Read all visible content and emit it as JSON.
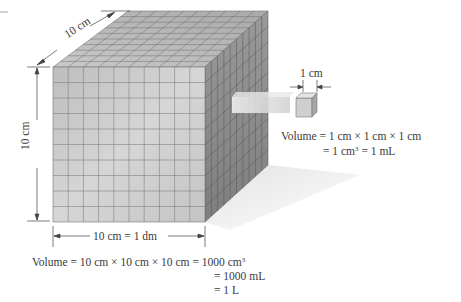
{
  "diagram": {
    "large_cube": {
      "depth_label": "10 cm",
      "height_label": "10 cm",
      "width_label": "10 cm = 1 dm",
      "grid_divisions": 10
    },
    "small_cube": {
      "edge_label": "1 cm"
    },
    "small_volume": {
      "line1": "Volume = 1 cm × 1 cm × 1 cm",
      "line2_prefix": "= 1 cm",
      "line2_sup": "3",
      "line2_suffix": " = 1 mL"
    },
    "large_volume": {
      "line1_prefix": "Volume = 10 cm × 10 cm × 10 cm = 1000 cm",
      "line1_sup": "3",
      "line2": "= 1000 mL",
      "line3": "= 1 L"
    },
    "colors": {
      "front_face": "#c8c8c8",
      "top_face": "#bdbdbd",
      "side_face": "#8f8f8f",
      "grid_line": "#6e6e6e",
      "shadow": "#ececec"
    }
  }
}
